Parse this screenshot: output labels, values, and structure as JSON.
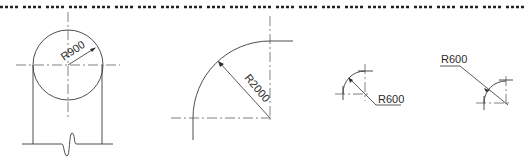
{
  "drawing": {
    "border_style": "dashed",
    "figures": [
      {
        "id": "circle-column",
        "dimension_label": "R900"
      },
      {
        "id": "quarter-arc-large",
        "dimension_label": "R2000"
      },
      {
        "id": "quarter-arc-small-left",
        "dimension_label": "R600"
      },
      {
        "id": "quarter-arc-small-right",
        "dimension_label": "R600"
      }
    ]
  },
  "colors": {
    "line": "#3a3a3a",
    "background": "#ffffff"
  }
}
